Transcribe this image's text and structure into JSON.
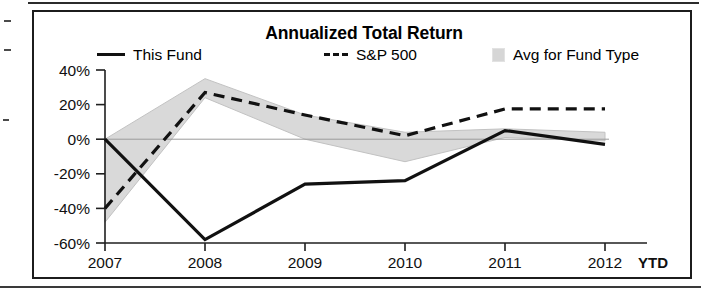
{
  "chart_data": {
    "type": "line",
    "title": "Annualized Total Return",
    "xlabel": "",
    "ylabel": "",
    "x": [
      "2007",
      "2008",
      "2009",
      "2010",
      "2011",
      "2012"
    ],
    "x_axis_note": "YTD",
    "ylim": [
      -60,
      40
    ],
    "ytick_labels": [
      "40%",
      "20%",
      "0%",
      "-20%",
      "-40%",
      "-60%"
    ],
    "ytick_values": [
      40,
      20,
      0,
      -20,
      -40,
      -60
    ],
    "grid": false,
    "legend_position": "top",
    "series": [
      {
        "name": "This Fund",
        "style": "solid",
        "color": "#111111",
        "values": [
          0,
          -58,
          -26,
          -24,
          5,
          -3
        ]
      },
      {
        "name": "S&P 500",
        "style": "dashed",
        "color": "#111111",
        "values": [
          -40,
          27,
          14,
          2,
          17.5,
          17.5
        ]
      }
    ],
    "band": {
      "name": "Avg for Fund Type",
      "color": "#d9d9d9",
      "upper": [
        0,
        35,
        14,
        4,
        6,
        4
      ],
      "lower": [
        -48,
        24,
        0,
        -13,
        1,
        -1
      ]
    }
  },
  "chart": {
    "title": "Annualized Total Return",
    "legend": [
      {
        "label": "This Fund",
        "swatch": "solid-line-swatch"
      },
      {
        "label": "S&P 500",
        "swatch": "dashed-line-swatch"
      },
      {
        "label": "Avg for Fund Type",
        "swatch": "gray-band-swatch"
      }
    ],
    "ytd_label": "YTD"
  }
}
